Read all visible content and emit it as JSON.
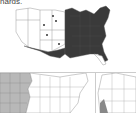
{
  "caption": {
    "text": "hards."
  },
  "maps": [
    {
      "id": "main-map",
      "description": "Contiguous US map; eastern half shaded dark, point markers in several central/plains states",
      "shaded_region": "eastern-us",
      "shade_color": "#3a3a3a",
      "marker_count": 5,
      "marker_color": "#333333"
    },
    {
      "id": "bottom-left-map",
      "description": "Contiguous US map (partially cropped); western Great Plains/mountain states shaded light gray",
      "shaded_region": "western-plains",
      "shade_color": "#b8b8b8"
    },
    {
      "id": "bottom-right-map",
      "description": "Western US detail map (cropped); small region in southwest shaded",
      "shaded_region": "southwest",
      "shade_color": "#888888"
    }
  ]
}
